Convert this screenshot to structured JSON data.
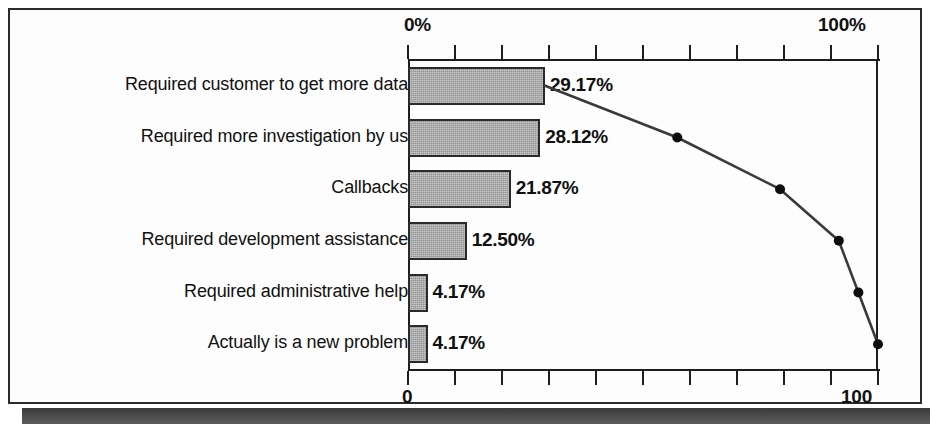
{
  "chart_data": {
    "type": "bar",
    "title": "",
    "subtitle": "",
    "xlabel": "",
    "ylabel": "",
    "orientation": "horizontal",
    "categories": [
      "Required customer to get more data",
      "Required more investigation by us",
      "Callbacks",
      "Required development assistance",
      "Required administrative help",
      "Actually is a new problem"
    ],
    "values": [
      29.17,
      28.12,
      21.87,
      12.5,
      4.17,
      4.17
    ],
    "value_labels": [
      "29.17%",
      "28.12%",
      "21.87%",
      "12.50%",
      "4.17%",
      "4.17%"
    ],
    "series": [
      {
        "name": "Percent of occurrences",
        "type": "bar",
        "values": [
          29.17,
          28.12,
          21.87,
          12.5,
          4.17,
          4.17
        ]
      },
      {
        "name": "Cumulative percent",
        "type": "line",
        "values": [
          29.17,
          57.29,
          79.16,
          91.66,
          95.83,
          100.0
        ]
      }
    ],
    "axes": {
      "top": {
        "position": "top",
        "min_label": "0%",
        "max_label": "100%",
        "range": [
          0,
          100
        ],
        "ticks": 11,
        "tick_step": 10
      },
      "bottom": {
        "position": "bottom",
        "min_label": "0",
        "max_label": "100",
        "range": [
          0,
          100
        ],
        "ticks": 11,
        "tick_step": 10
      }
    },
    "grid": false,
    "legend": "none",
    "colors": {
      "bar_fill": "#949494",
      "bar_border": "#2a2a2a",
      "line": "#3a3a3a",
      "marker": "#0d0d0d",
      "axis": "#1e1e1e",
      "text": "#111111",
      "background": "#ffffff",
      "frame": "#2b2b2b"
    }
  },
  "axis_top": {
    "left_label": "0%",
    "right_label": "100%"
  },
  "axis_bottom": {
    "left_label": "0",
    "right_label": "100"
  }
}
